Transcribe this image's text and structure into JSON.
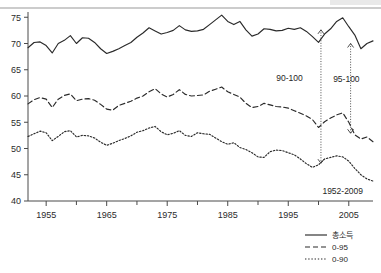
{
  "chart_data": {
    "type": "line",
    "title": "",
    "subtitle": "",
    "xlabel": "",
    "ylabel": "",
    "xlim": [
      1952,
      2009
    ],
    "ylim": [
      40,
      76
    ],
    "xticks": [
      1955,
      1965,
      1975,
      1985,
      1995,
      2005
    ],
    "xticklabels": [
      "1955",
      "1965",
      "1975",
      "1985",
      "1995",
      "2005"
    ],
    "xminorticks": [
      1960,
      1970,
      1980,
      1990,
      2000
    ],
    "yticks": [
      40,
      45,
      50,
      55,
      60,
      65,
      70,
      75
    ],
    "yticklabels": [
      "40",
      "45",
      "50",
      "55",
      "60",
      "65",
      "70",
      "75"
    ],
    "grid": false,
    "legend_position": "bottom-right",
    "x": [
      1952,
      1953,
      1954,
      1955,
      1956,
      1957,
      1958,
      1959,
      1960,
      1961,
      1962,
      1963,
      1964,
      1965,
      1966,
      1967,
      1968,
      1969,
      1970,
      1971,
      1972,
      1973,
      1974,
      1975,
      1976,
      1977,
      1978,
      1979,
      1980,
      1981,
      1982,
      1983,
      1984,
      1985,
      1986,
      1987,
      1988,
      1989,
      1990,
      1991,
      1992,
      1993,
      1994,
      1995,
      1996,
      1997,
      1998,
      1999,
      2000,
      2001,
      2002,
      2003,
      2004,
      2005,
      2006,
      2007,
      2008,
      2009
    ],
    "series": [
      {
        "name": "총소득",
        "style": "solid",
        "values": [
          69.2,
          70.2,
          70.3,
          69.6,
          68.2,
          70.0,
          70.6,
          71.5,
          70.0,
          71.1,
          71.0,
          70.2,
          69.0,
          68.1,
          68.5,
          69.0,
          69.6,
          70.2,
          71.2,
          72.0,
          73.0,
          72.4,
          71.8,
          72.1,
          72.5,
          73.4,
          72.6,
          72.3,
          72.4,
          72.7,
          73.6,
          74.5,
          75.4,
          74.2,
          73.6,
          74.2,
          72.6,
          71.4,
          71.8,
          72.8,
          72.7,
          72.4,
          72.5,
          72.9,
          72.7,
          73.0,
          72.3,
          71.3,
          70.2,
          71.8,
          72.8,
          74.2,
          74.9,
          73.2,
          71.6,
          69.0,
          70.0,
          70.5
        ]
      },
      {
        "name": "0-95",
        "style": "dashed",
        "values": [
          58.5,
          59.3,
          59.7,
          59.4,
          57.8,
          59.4,
          60.1,
          60.4,
          59.1,
          59.4,
          59.5,
          59.2,
          58.4,
          57.5,
          57.3,
          58.2,
          58.6,
          59.0,
          59.6,
          60.0,
          60.8,
          61.4,
          60.4,
          59.8,
          60.3,
          61.2,
          60.3,
          60.0,
          60.1,
          60.2,
          60.9,
          61.3,
          61.7,
          60.8,
          60.3,
          59.8,
          58.6,
          57.8,
          58.0,
          58.6,
          58.3,
          58.0,
          57.9,
          57.7,
          57.2,
          56.7,
          56.2,
          55.5,
          54.0,
          55.1,
          55.8,
          56.4,
          56.8,
          55.0,
          52.6,
          51.8,
          52.2,
          51.3
        ]
      },
      {
        "name": "0-90",
        "style": "dotted",
        "values": [
          52.3,
          52.8,
          53.3,
          53.0,
          51.5,
          52.3,
          53.2,
          53.4,
          52.2,
          52.5,
          52.4,
          52.0,
          51.2,
          50.6,
          51.0,
          51.5,
          51.9,
          52.4,
          53.1,
          53.4,
          53.9,
          54.2,
          53.2,
          52.6,
          52.9,
          53.4,
          52.5,
          52.3,
          53.0,
          52.8,
          52.7,
          52.0,
          51.3,
          50.8,
          51.1,
          50.2,
          49.8,
          49.2,
          48.4,
          48.3,
          49.4,
          49.7,
          49.6,
          49.2,
          48.8,
          48.0,
          47.1,
          46.4,
          46.9,
          48.0,
          48.3,
          48.6,
          48.4,
          47.6,
          46.2,
          45.0,
          44.2,
          43.8
        ]
      }
    ],
    "annotations": [
      {
        "text": "90-100",
        "x": 1995.2,
        "y": 62.8
      },
      {
        "text": "95-100",
        "x": 2004.6,
        "y": 62.6
      },
      {
        "text": "1952-2009",
        "x": 2004.0,
        "y": 41.4
      }
    ],
    "arrows": [
      {
        "from_year": 2000.4,
        "from_value": 72.6,
        "to_value": 47.2
      },
      {
        "from_year": 2005.3,
        "from_value": 70.0,
        "to_value": 52.9
      }
    ]
  },
  "legend": {
    "items": [
      {
        "label": "총소득",
        "style": "solid"
      },
      {
        "label": "0-95",
        "style": "dashed"
      },
      {
        "label": "0-90",
        "style": "dotted"
      }
    ]
  }
}
